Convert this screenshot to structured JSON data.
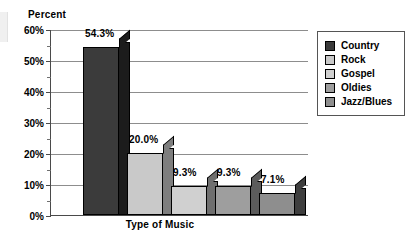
{
  "chart_data": {
    "type": "bar",
    "title": "",
    "xlabel": "Type of Music",
    "ylabel": "Percent",
    "categories": [
      "Country",
      "Rock",
      "Gospel",
      "Oldies",
      "Jazz/Blues"
    ],
    "values": [
      54.3,
      20.0,
      9.3,
      9.3,
      7.1
    ],
    "data_labels": [
      "54.3%",
      "20.0%",
      "9.3%",
      "9.3%",
      "7.1%"
    ],
    "ylim": [
      0,
      60
    ],
    "ytick_values": [
      0,
      10,
      20,
      30,
      40,
      50,
      60
    ],
    "ytick_labels": [
      "0%",
      "10%",
      "20%",
      "30%",
      "40%",
      "50%",
      "60%"
    ],
    "minor_tick_values": [
      5,
      15,
      25,
      35,
      45,
      55
    ],
    "grid": "horizontal",
    "legend_position": "right",
    "style": "3d-bar",
    "series_colors": [
      "#3b3b3b",
      "#c9c9c9",
      "#d0d0d0",
      "#9e9e9e",
      "#8e8e8e"
    ],
    "series_side_colors": [
      "#1c1c1c",
      "#7e7e7e",
      "#6f6f6f",
      "#5c5c5c",
      "#3f3f3f"
    ],
    "bars": [
      {
        "label": "Country",
        "value": 54.3,
        "data_label": "54.3%",
        "color": "#3b3b3b",
        "side_color": "#1c1c1c"
      },
      {
        "label": "Rock",
        "value": 20.0,
        "data_label": "20.0%",
        "color": "#c9c9c9",
        "side_color": "#7e7e7e"
      },
      {
        "label": "Gospel",
        "value": 9.3,
        "data_label": "9.3%",
        "color": "#d0d0d0",
        "side_color": "#6f6f6f"
      },
      {
        "label": "Oldies",
        "value": 9.3,
        "data_label": "9.3%",
        "color": "#9e9e9e",
        "side_color": "#5c5c5c"
      },
      {
        "label": "Jazz/Blues",
        "value": 7.1,
        "data_label": "7.1%",
        "color": "#8e8e8e",
        "side_color": "#3f3f3f"
      }
    ]
  },
  "axes": {
    "y_title": "Percent",
    "x_title": "Type of Music"
  },
  "legend": {
    "items": [
      {
        "label": "Country",
        "color": "#3b3b3b"
      },
      {
        "label": "Rock",
        "color": "#c9c9c9"
      },
      {
        "label": "Gospel",
        "color": "#d0d0d0"
      },
      {
        "label": "Oldies",
        "color": "#9e9e9e"
      },
      {
        "label": "Jazz/Blues",
        "color": "#8e8e8e"
      }
    ]
  }
}
